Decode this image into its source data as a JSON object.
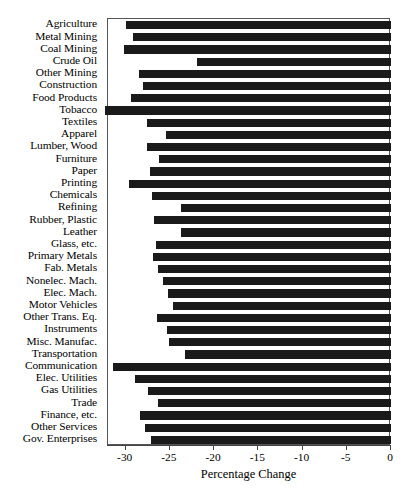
{
  "chart_data": {
    "type": "bar",
    "orientation": "horizontal",
    "title": "",
    "subtitle": "",
    "xlabel": "Percentage Change",
    "ylabel": "",
    "xlim": [
      -32,
      0
    ],
    "xticks": [
      -30,
      -25,
      -20,
      -15,
      -10,
      -5,
      0
    ],
    "xticklabels": [
      "-30",
      "-25",
      "-20",
      "-15",
      "-10",
      "-5",
      "0"
    ],
    "grid": false,
    "legend": false,
    "legend_position": "none",
    "bar_color": "#1a1a1a",
    "categories": [
      "Agriculture",
      "Metal Mining",
      "Coal Mining",
      "Crude Oil",
      "Other Mining",
      "Construction",
      "Food Products",
      "Tobacco",
      "Textiles",
      "Apparel",
      "Lumber, Wood",
      "Furniture",
      "Paper",
      "Printing",
      "Chemicals",
      "Refining",
      "Rubber, Plastic",
      "Leather",
      "Glass, etc.",
      "Primary Metals",
      "Fab. Metals",
      "Nonelec. Mach.",
      "Elec. Mach.",
      "Motor Vehicles",
      "Other Trans. Eq.",
      "Instruments",
      "Misc. Manufac.",
      "Transportation",
      "Communication",
      "Elec. Utilities",
      "Gas Utilities",
      "Trade",
      "Finance, etc.",
      "Other Services",
      "Gov. Enterprises"
    ],
    "values": [
      -30.0,
      -29.2,
      -30.2,
      -21.9,
      -28.5,
      -28.0,
      -29.4,
      -32.3,
      -27.6,
      -25.4,
      -27.6,
      -26.2,
      -27.3,
      -29.6,
      -27.0,
      -23.8,
      -26.8,
      -23.7,
      -26.6,
      -26.9,
      -26.3,
      -25.8,
      -25.2,
      -24.6,
      -26.5,
      -25.3,
      -25.1,
      -23.3,
      -31.4,
      -28.9,
      -27.5,
      -26.4,
      -28.4,
      -27.8,
      -27.1
    ]
  }
}
